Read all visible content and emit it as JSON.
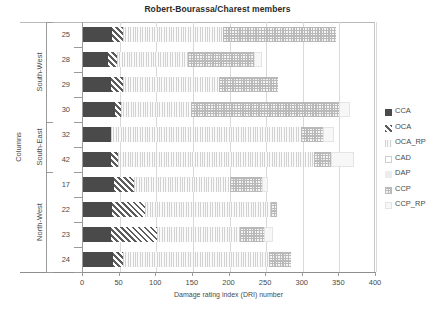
{
  "chart_data": {
    "type": "bar",
    "orientation": "horizontal",
    "stacked": true,
    "title": "Robert-Bourassa/Charest members",
    "xlabel": "Damage rating index (DRI) number",
    "ylabel": "Columns",
    "xlim": [
      0,
      400
    ],
    "xticks": [
      0,
      50,
      100,
      150,
      200,
      250,
      300,
      350,
      400
    ],
    "grid": true,
    "legend_position": "right",
    "categories": [
      "25",
      "28",
      "29",
      "30",
      "32",
      "42",
      "17",
      "22",
      "23",
      "24"
    ],
    "groups": [
      {
        "label": "South-West",
        "categories": [
          "25",
          "28",
          "29",
          "30"
        ]
      },
      {
        "label": "South-East",
        "categories": [
          "32",
          "42"
        ]
      },
      {
        "label": "North-West",
        "categories": [
          "17",
          "22",
          "23",
          "24"
        ]
      }
    ],
    "series": [
      {
        "name": "CCA",
        "values": [
          40,
          34,
          38,
          44,
          38,
          38,
          42,
          40,
          38,
          41
        ]
      },
      {
        "name": "OCA",
        "values": [
          14,
          12,
          16,
          8,
          0,
          10,
          28,
          44,
          63,
          14
        ]
      },
      {
        "name": "OCA_RP",
        "values": [
          137,
          98,
          131,
          96,
          260,
          268,
          130,
          173,
          113,
          199
        ]
      },
      {
        "name": "CAD",
        "values": [
          0,
          0,
          0,
          0,
          0,
          0,
          0,
          0,
          0,
          0
        ]
      },
      {
        "name": "DAP",
        "values": [
          0,
          0,
          0,
          0,
          0,
          0,
          0,
          0,
          0,
          0
        ]
      },
      {
        "name": "CCP",
        "values": [
          154,
          90,
          81,
          202,
          30,
          23,
          44,
          8,
          33,
          30
        ]
      },
      {
        "name": "CCP_RP",
        "values": [
          0,
          11,
          0,
          14,
          15,
          31,
          9,
          0,
          12,
          0
        ]
      }
    ]
  },
  "legend": {
    "items": [
      {
        "label": "CCA",
        "pattern": "solid-dark"
      },
      {
        "label": "OCA",
        "pattern": "diagonal-hatch"
      },
      {
        "label": "OCA_RP",
        "pattern": "vertical-fine"
      },
      {
        "label": "CAD",
        "pattern": "white-outline"
      },
      {
        "label": "DAP",
        "pattern": "light-grey"
      },
      {
        "label": "CCP",
        "pattern": "checker"
      },
      {
        "label": "CCP_RP",
        "pattern": "pale"
      }
    ]
  }
}
